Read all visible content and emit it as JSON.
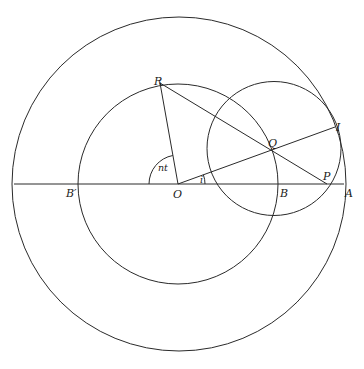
{
  "diagram": {
    "type": "geometric-construction",
    "colors": {
      "background": "#ffffff",
      "stroke": "#2a2a2a",
      "label": "#1a1a1a"
    },
    "circles": [
      {
        "id": "outer",
        "cx": 179,
        "cy": 184,
        "r": 167
      },
      {
        "id": "middle",
        "cx": 178,
        "cy": 184,
        "r": 100
      },
      {
        "id": "small",
        "cx": 274,
        "cy": 148.5,
        "r": 67
      }
    ],
    "points": {
      "O": {
        "x": 178,
        "y": 184
      },
      "R": {
        "x": 160,
        "y": 83
      },
      "Q": {
        "x": 272,
        "y": 150
      },
      "I": {
        "x": 335,
        "y": 127
      },
      "P": {
        "x": 327,
        "y": 184
      },
      "A": {
        "x": 344,
        "y": 184
      },
      "B": {
        "x": 277,
        "y": 184
      },
      "B_prime": {
        "x": 79,
        "y": 184
      }
    },
    "labels": {
      "R": "R",
      "Q": "Q",
      "I": "I",
      "P": "P",
      "A": "A",
      "B": "B",
      "B_prime": "B′",
      "O": "O",
      "angle_nt": "nt",
      "angle_i": "i"
    }
  }
}
